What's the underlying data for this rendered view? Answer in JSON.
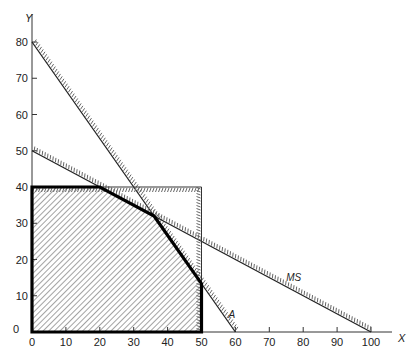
{
  "chart_data": {
    "type": "line",
    "title": "",
    "xlabel": "X",
    "ylabel": "Y",
    "xlim": [
      0,
      100
    ],
    "ylim": [
      0,
      80
    ],
    "x_ticks": [
      0,
      10,
      20,
      30,
      40,
      50,
      60,
      70,
      80,
      90,
      100
    ],
    "y_ticks": [
      0,
      10,
      20,
      30,
      40,
      50,
      60,
      70,
      80
    ],
    "grid": false,
    "series": [
      {
        "name": "A",
        "points": [
          [
            0,
            80
          ],
          [
            60,
            0
          ]
        ],
        "style": "constraint line with hatching below-left"
      },
      {
        "name": "MS",
        "points": [
          [
            0,
            50
          ],
          [
            100,
            0
          ]
        ],
        "style": "constraint line with hatching below-left"
      },
      {
        "name": "y<=40",
        "points": [
          [
            0,
            40
          ],
          [
            50,
            40
          ]
        ],
        "style": "thin boundary with comb hatching"
      },
      {
        "name": "x<=50",
        "points": [
          [
            50,
            0
          ],
          [
            50,
            40
          ]
        ],
        "style": "thin boundary with comb hatching"
      }
    ],
    "feasible_region": {
      "vertices": [
        [
          0,
          0
        ],
        [
          0,
          40
        ],
        [
          20,
          40
        ],
        [
          36,
          32
        ],
        [
          50,
          13.33
        ],
        [
          50,
          0
        ]
      ],
      "style": "diagonally hatched polygon with heavy outline"
    },
    "annotations": [
      {
        "text": "A",
        "x": 58,
        "y": 4
      },
      {
        "text": "MS",
        "x": 75,
        "y": 14
      }
    ]
  },
  "labels": {
    "x_axis": "X",
    "y_axis": "Y",
    "line_a": "A",
    "line_ms": "MS"
  }
}
